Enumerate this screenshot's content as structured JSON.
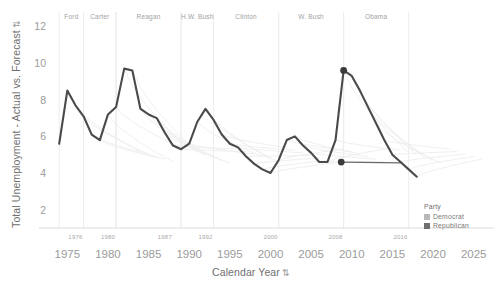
{
  "chart_data": {
    "type": "line",
    "title": "",
    "xlabel": "Calendar Year",
    "ylabel": "Total Unemployment - Actual vs. Forecast",
    "xlim": [
      1972.5,
      2027.5
    ],
    "ylim": [
      1.0,
      12.9
    ],
    "grid": false,
    "legend_position": "bottom-right",
    "x_ticks": [
      1975,
      1980,
      1985,
      1990,
      1995,
      2000,
      2005,
      2010,
      2015,
      2020,
      2025
    ],
    "x_minor_ticks": [
      1976,
      1980,
      1987,
      1992,
      2000,
      2008,
      2016
    ],
    "y_ticks": [
      2,
      4,
      6,
      8,
      10,
      12
    ],
    "series": [
      {
        "name": "Actual",
        "style": "solid",
        "color": "#4a4a4a",
        "x": [
          1974,
          1975,
          1976,
          1977,
          1978,
          1979,
          1980,
          1981,
          1982,
          1983,
          1984,
          1985,
          1986,
          1987,
          1988,
          1989,
          1990,
          1991,
          1992,
          1993,
          1994,
          1995,
          1996,
          1997,
          1998,
          1999,
          2000,
          2001,
          2002,
          2003,
          2004,
          2005,
          2006,
          2007,
          2008,
          2009,
          2010,
          2011,
          2012,
          2013,
          2014,
          2015,
          2016,
          2017,
          2018
        ],
        "values": [
          5.6,
          8.5,
          7.7,
          7.1,
          6.1,
          5.8,
          7.2,
          7.6,
          9.7,
          9.6,
          7.5,
          7.2,
          7.0,
          6.2,
          5.5,
          5.3,
          5.6,
          6.8,
          7.5,
          6.9,
          6.1,
          5.6,
          5.4,
          4.9,
          4.5,
          4.2,
          4.0,
          4.7,
          5.8,
          6.0,
          5.5,
          5.1,
          4.6,
          4.6,
          5.8,
          9.6,
          9.3,
          8.5,
          7.6,
          6.7,
          5.8,
          5.0,
          4.6,
          4.2,
          3.8
        ]
      },
      {
        "name": "Forecast",
        "style": "faint",
        "color": "#e8e8e8",
        "note": "Faint light-gray forecast trajectory lines branching from each year"
      }
    ],
    "highlighted_points": [
      {
        "x": 2009,
        "y": 9.6,
        "label": "",
        "color": "#3a3a3a"
      },
      {
        "x": 2008.7,
        "y": 4.6,
        "label": "",
        "color": "#3a3a3a"
      }
    ],
    "annotation_line": {
      "from_x": 2008.7,
      "from_y": 4.6,
      "to_x": 2016.2,
      "to_y": 4.55,
      "color": "#6b6b6b"
    },
    "president_bands": [
      {
        "label": "Ford",
        "start": 1974.0,
        "end": 1977.0,
        "party": "Republican"
      },
      {
        "label": "Carter",
        "start": 1977.0,
        "end": 1981.0,
        "party": "Democrat"
      },
      {
        "label": "Reagan",
        "start": 1981.0,
        "end": 1989.0,
        "party": "Republican"
      },
      {
        "label": "H.W. Bush",
        "start": 1989.0,
        "end": 1993.0,
        "party": "Republican"
      },
      {
        "label": "Clinton",
        "start": 1993.0,
        "end": 2001.0,
        "party": "Democrat"
      },
      {
        "label": "W. Bush",
        "start": 2001.0,
        "end": 2009.0,
        "party": "Republican"
      },
      {
        "label": "Obama",
        "start": 2009.0,
        "end": 2017.0,
        "party": "Democrat"
      }
    ]
  },
  "legend": {
    "title": "Party",
    "items": [
      {
        "label": "Democrat",
        "color": "#b9b9b9"
      },
      {
        "label": "Republican",
        "color": "#6e6e6e"
      }
    ]
  },
  "axes": {
    "x_title": "Calendar Year",
    "y_title": "Total Unemployment - Actual vs. Forecast",
    "sort_glyph": "⇅"
  }
}
